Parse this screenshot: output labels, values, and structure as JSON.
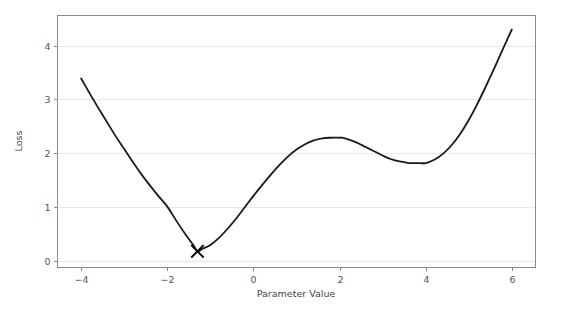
{
  "chart_data": {
    "type": "line",
    "title": "",
    "xlabel": "Parameter Value",
    "ylabel": "Loss",
    "xlim": [
      -4.55,
      6.55
    ],
    "ylim": [
      -0.12,
      4.56
    ],
    "xticks": [
      -4,
      -2,
      0,
      2,
      4,
      6
    ],
    "xtick_labels": [
      "−4",
      "−2",
      "0",
      "2",
      "4",
      "6"
    ],
    "yticks": [
      0,
      1,
      2,
      3,
      4
    ],
    "ytick_labels": [
      "0",
      "1",
      "2",
      "3",
      "4"
    ],
    "grid": "horizontal-only",
    "legend": "none",
    "line_color": "#1a1a1a",
    "grid_color": "#e8e8e8",
    "spine_color": "#8a8a8a",
    "series": [
      {
        "name": "loss-curve",
        "color": "#1a1a1a",
        "x": [
          -4.0,
          -3.8,
          -3.6,
          -3.4,
          -3.2,
          -3.0,
          -2.8,
          -2.6,
          -2.4,
          -2.2,
          -2.0,
          -1.8,
          -1.6,
          -1.4,
          -1.3,
          -1.2,
          -1.0,
          -0.8,
          -0.6,
          -0.4,
          -0.2,
          0.0,
          0.2,
          0.4,
          0.6,
          0.8,
          1.0,
          1.2,
          1.4,
          1.6,
          1.8,
          2.0,
          2.05,
          2.2,
          2.4,
          2.6,
          2.8,
          3.0,
          3.2,
          3.4,
          3.6,
          3.8,
          4.0,
          4.2,
          4.4,
          4.6,
          4.8,
          5.0,
          5.2,
          5.4,
          5.6,
          5.8,
          6.0
        ],
        "y": [
          3.39,
          3.11,
          2.84,
          2.58,
          2.32,
          2.08,
          1.84,
          1.61,
          1.4,
          1.2,
          1.01,
          0.76,
          0.52,
          0.3,
          0.18,
          0.22,
          0.3,
          0.43,
          0.6,
          0.79,
          1.0,
          1.21,
          1.41,
          1.6,
          1.78,
          1.94,
          2.07,
          2.17,
          2.24,
          2.28,
          2.29,
          2.29,
          2.29,
          2.26,
          2.2,
          2.12,
          2.04,
          1.96,
          1.89,
          1.85,
          1.82,
          1.82,
          1.82,
          1.88,
          1.99,
          2.15,
          2.36,
          2.62,
          2.92,
          3.25,
          3.59,
          3.95,
          4.3
        ]
      }
    ],
    "annotations": [
      {
        "name": "global-minimum-marker",
        "marker": "x",
        "x": -1.3,
        "y": 0.18,
        "color": "#000000"
      }
    ]
  }
}
